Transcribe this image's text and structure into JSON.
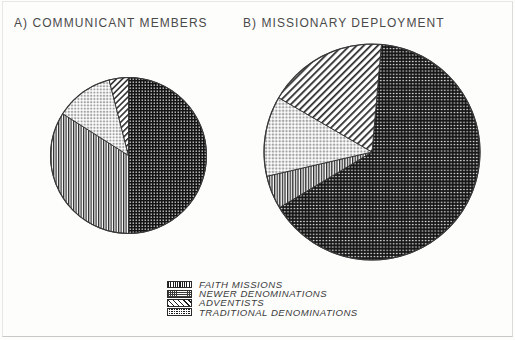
{
  "figure": {
    "background_color": "#fdfdfc",
    "border_color": "#e8e7e4"
  },
  "charts": {
    "a": {
      "title": "A) COMMUNICANT MEMBERS"
    },
    "b": {
      "title": "B) MISSIONARY DEPLOYMENT"
    }
  },
  "legend": {
    "items": [
      {
        "label": "FAITH MISSIONS",
        "pattern": "vertical-stripes",
        "swatch_icon": "vertical-stripe-swatch-icon"
      },
      {
        "label": "NEWER DENOMINATIONS",
        "pattern": "fine-dots",
        "swatch_icon": "fine-dot-swatch-icon"
      },
      {
        "label": "ADVENTISTS",
        "pattern": "diagonal-stripes",
        "swatch_icon": "diagonal-stripe-swatch-icon"
      },
      {
        "label": "TRADITIONAL DENOMINATIONS",
        "pattern": "dense-checker",
        "swatch_icon": "dense-checker-swatch-icon"
      }
    ]
  },
  "chart_data": [
    {
      "type": "pie",
      "id": "a",
      "title": "A) COMMUNICANT MEMBERS",
      "categories": [
        "Traditional Denominations",
        "Faith Missions",
        "Newer Denominations",
        "Adventists"
      ],
      "values": [
        50,
        34,
        12,
        4
      ],
      "unit": "percent",
      "start_angle_deg": 0,
      "direction": "clockwise",
      "patterns": [
        "dense-checker",
        "vertical-stripes",
        "fine-dots",
        "diagonal-stripes"
      ],
      "legend_position": "bottom-center",
      "grid": false,
      "xlabel": "",
      "ylabel": ""
    },
    {
      "type": "pie",
      "id": "b",
      "title": "B) MISSIONARY DEPLOYMENT",
      "categories": [
        "Traditional Denominations",
        "Faith Missions",
        "Newer Denominations",
        "Adventists"
      ],
      "values": [
        65,
        5,
        12,
        18
      ],
      "unit": "percent",
      "start_angle_deg": 5,
      "direction": "clockwise",
      "patterns": [
        "dense-checker",
        "vertical-stripes",
        "fine-dots",
        "diagonal-stripes"
      ],
      "legend_position": "bottom-center",
      "grid": false,
      "xlabel": "",
      "ylabel": ""
    }
  ]
}
